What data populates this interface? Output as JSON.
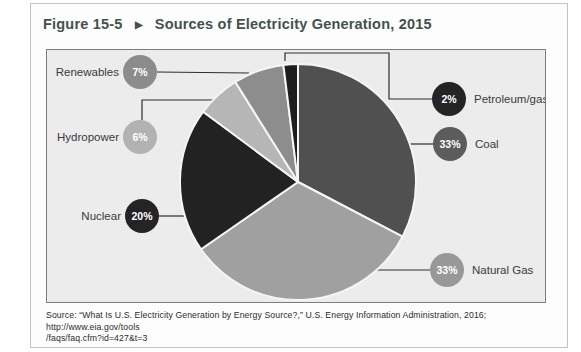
{
  "figure": {
    "label": "Figure 15-5",
    "arrow": "▶",
    "title": "Sources of Electricity Generation, 2015"
  },
  "chart_data": {
    "type": "pie",
    "title": "Sources of Electricity Generation, 2015",
    "unit": "percent of total electricity generation",
    "clockwise_from_top": true,
    "slices": [
      {
        "label": "Coal",
        "value": 33,
        "display": "33%",
        "slice_color": "#505050",
        "badge_color": "#5c5c5c",
        "label_side": "right"
      },
      {
        "label": "Natural Gas",
        "value": 33,
        "display": "33%",
        "slice_color": "#a0a0a0",
        "badge_color": "#989898",
        "label_side": "right"
      },
      {
        "label": "Nuclear",
        "value": 20,
        "display": "20%",
        "slice_color": "#222222",
        "badge_color": "#242424",
        "label_side": "left"
      },
      {
        "label": "Hydropower",
        "value": 6,
        "display": "6%",
        "slice_color": "#b6b6b6",
        "badge_color": "#b2b2b2",
        "label_side": "left"
      },
      {
        "label": "Renewables",
        "value": 7,
        "display": "7%",
        "slice_color": "#8d8d8d",
        "badge_color": "#8c8c8c",
        "label_side": "left"
      },
      {
        "label": "Petroleum/gas",
        "value": 2,
        "display": "2%",
        "slice_color": "#1d1d1d",
        "badge_color": "#242424",
        "label_side": "right"
      }
    ]
  },
  "source": {
    "lines": [
      "Source: “What Is U.S. Electricity Generation by Energy Source?,” U.S. Energy Information Administration, 2016; http://www.eia.gov/tools",
      "/faqs/faq.cfm?id=427&t=3"
    ]
  }
}
